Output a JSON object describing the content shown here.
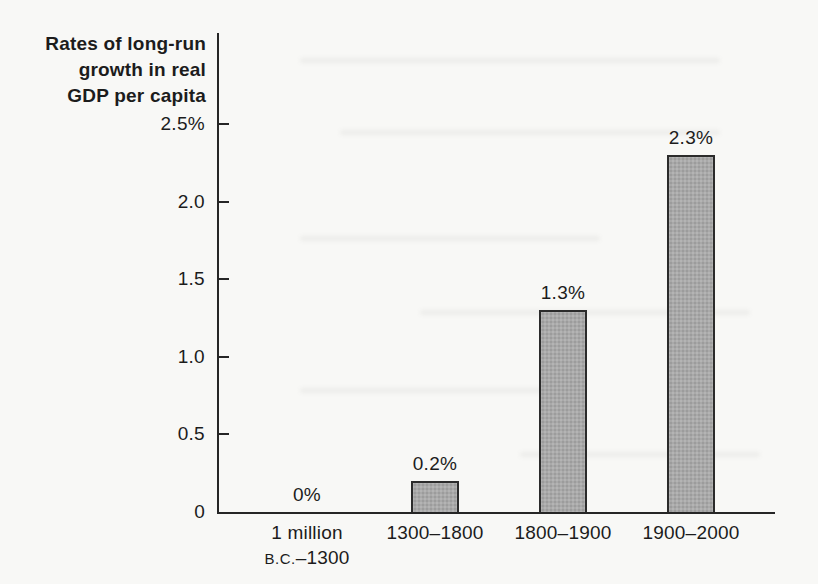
{
  "title": "Rates of long-run\ngrowth in real\nGDP per capita",
  "chart_data": {
    "type": "bar",
    "title": "Rates of long-run growth in real GDP per capita",
    "categories": [
      "1 million\nB.C.–1300",
      "1300–1800",
      "1800–1900",
      "1900–2000"
    ],
    "values": [
      0,
      0.2,
      1.3,
      2.3
    ],
    "bar_labels": [
      "0%",
      "0.2%",
      "1.3%",
      "2.3%"
    ],
    "yticks": [
      0,
      0.5,
      1.0,
      1.5,
      2.0,
      2.5
    ],
    "ytick_labels": [
      "0",
      "0.5",
      "1.0",
      "1.5",
      "2.0",
      "2.5%"
    ],
    "ylim": [
      0,
      2.5
    ],
    "unit": "%",
    "xlabel": "",
    "ylabel": "",
    "grid": false,
    "legend": false,
    "colors": {
      "bar_fill": "#a9a9a9",
      "bar_border": "#2b2b2b",
      "axis": "#262626",
      "ink": "#1c1c1c",
      "background": "#f8f8f6"
    }
  }
}
